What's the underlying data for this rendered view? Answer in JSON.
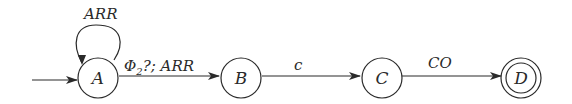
{
  "diagram": {
    "type": "finite-state-automaton",
    "states": [
      {
        "id": "A",
        "label": "A",
        "initial": true,
        "accepting": false
      },
      {
        "id": "B",
        "label": "B",
        "initial": false,
        "accepting": false
      },
      {
        "id": "C",
        "label": "C",
        "initial": false,
        "accepting": false
      },
      {
        "id": "D",
        "label": "D",
        "initial": false,
        "accepting": true
      }
    ],
    "transitions": [
      {
        "from": "A",
        "to": "A",
        "label": "ARR"
      },
      {
        "from": "A",
        "to": "B",
        "label_main": "Φ",
        "label_sub": "2",
        "label_rest": "?; ARR"
      },
      {
        "from": "B",
        "to": "C",
        "label": "c"
      },
      {
        "from": "C",
        "to": "D",
        "label": "CO"
      }
    ],
    "colors": {
      "stroke": "#2a2a2a",
      "background": "#ffffff"
    }
  }
}
